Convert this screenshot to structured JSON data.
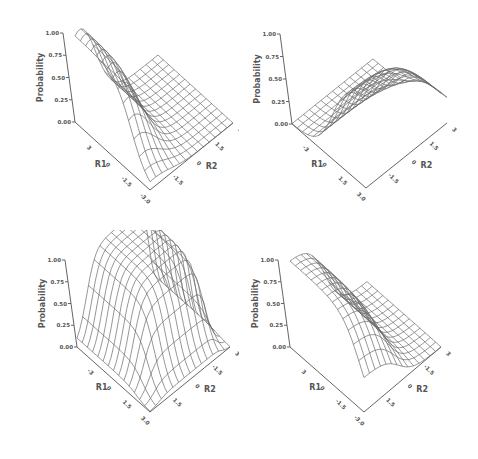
{
  "chart_data": [
    {
      "type": "surface",
      "title": "",
      "zlabel": "Probability",
      "xlabel": "R1",
      "ylabel": "R2",
      "zticks": [
        "0.00",
        "0.25",
        "0.50",
        "0.75",
        "1.00"
      ],
      "xticks": [
        "3",
        "0",
        "-1.5",
        "-3.0"
      ],
      "yticks": [
        "-1.5",
        "0",
        "1.5",
        "3"
      ],
      "zlim": [
        0,
        1
      ],
      "shape": "gaussian-ridge",
      "description": "Bell-shaped peak (max 1.00) along the back-right edge, near zero elsewhere"
    },
    {
      "type": "surface",
      "title": "",
      "zlabel": "Probability",
      "xlabel": "R1",
      "ylabel": "R2",
      "zticks": [
        "0.00",
        "0.25",
        "0.50",
        "0.75",
        "1.00"
      ],
      "xticks": [
        "-3",
        "0",
        "1.5",
        "3.0"
      ],
      "yticks": [
        "-1.5",
        "0",
        "1.5",
        "3"
      ],
      "zlim": [
        0,
        1
      ],
      "shape": "sigmoid-rise",
      "description": "Flat near 0 at back-left, rising sigmoidally to 1.00 toward the right corner"
    },
    {
      "type": "surface",
      "title": "",
      "zlabel": "Probability",
      "xlabel": "R1",
      "ylabel": "R2",
      "zticks": [
        "0.00",
        "0.25",
        "0.50",
        "0.75",
        "1.00"
      ],
      "xticks": [
        "-3",
        "0",
        "1.5",
        "3.0"
      ],
      "yticks": [
        "1.5",
        "0",
        "-1.5",
        "3"
      ],
      "zlim": [
        0,
        1
      ],
      "shape": "plateau",
      "description": "Broad plateau near 1.00 over the back region, dropping to 0 at front"
    },
    {
      "type": "surface",
      "title": "",
      "zlabel": "Probability",
      "xlabel": "R1",
      "ylabel": "R2",
      "zticks": [
        "0.00",
        "0.25",
        "0.50",
        "0.75",
        "1.00"
      ],
      "xticks": [
        "3",
        "0",
        "-1.5",
        "-3.0"
      ],
      "yticks": [
        "1.5",
        "0",
        "-1.5",
        "3"
      ],
      "zlim": [
        0,
        1
      ],
      "shape": "sigmoid-fall",
      "description": "High (1.00) at back-left corner, decaying sigmoidally to 0 toward the front-right"
    }
  ],
  "panels": [
    {
      "origin": [
        75,
        122
      ],
      "front": [
        150,
        190
      ],
      "right": [
        233,
        123
      ],
      "zheight": 89
    },
    {
      "origin": [
        52,
        124
      ],
      "front": [
        126,
        188
      ],
      "right": [
        207,
        123
      ],
      "zheight": 90
    },
    {
      "origin": [
        77,
        117
      ],
      "front": [
        150,
        182
      ],
      "right": [
        230,
        117
      ],
      "zheight": 87
    },
    {
      "origin": [
        50,
        117
      ],
      "front": [
        124,
        182
      ],
      "right": [
        201,
        117
      ],
      "zheight": 87
    }
  ]
}
